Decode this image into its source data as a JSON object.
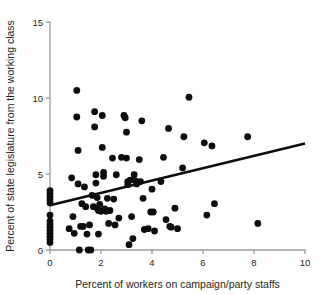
{
  "chart_data": {
    "type": "scatter",
    "title": "",
    "xlabel": "Percent of workers on campaign/party staffs",
    "ylabel": "Percent of state legislature from the working class",
    "xlim": [
      0,
      10
    ],
    "ylim": [
      0,
      15
    ],
    "xticks": [
      0,
      2,
      4,
      6,
      8,
      10
    ],
    "yticks": [
      0,
      5,
      10,
      15
    ],
    "xtick_labels": [
      "0",
      "2",
      "4",
      "6",
      "8",
      "10"
    ],
    "ytick_labels": [
      "0",
      "5",
      "10",
      "15"
    ],
    "grid": false,
    "legend": "none",
    "marker": "filled-circle",
    "marker_color": "#0d0d0d",
    "trend_line": {
      "type": "linear-fit",
      "color": "#0d0d0d",
      "x_start": 0,
      "y_start": 2.95,
      "x_end": 10,
      "y_end": 7.0,
      "slope": 0.405,
      "intercept": 2.95
    },
    "points": [
      [
        0.0,
        0.5
      ],
      [
        0.0,
        0.7
      ],
      [
        0.0,
        0.9
      ],
      [
        0.0,
        1.1
      ],
      [
        0.0,
        1.3
      ],
      [
        0.0,
        1.5
      ],
      [
        0.0,
        1.7
      ],
      [
        0.0,
        1.9
      ],
      [
        0.0,
        2.3
      ],
      [
        0.0,
        3.1
      ],
      [
        0.0,
        3.3
      ],
      [
        0.0,
        3.5
      ],
      [
        0.0,
        3.7
      ],
      [
        0.0,
        3.9
      ],
      [
        0.75,
        1.4
      ],
      [
        0.85,
        4.75
      ],
      [
        0.9,
        2.2
      ],
      [
        0.95,
        1.1
      ],
      [
        1.05,
        10.5
      ],
      [
        1.05,
        8.75
      ],
      [
        1.1,
        6.55
      ],
      [
        1.1,
        4.35
      ],
      [
        1.15,
        0.0
      ],
      [
        1.2,
        1.55
      ],
      [
        1.25,
        3.05
      ],
      [
        1.3,
        1.55
      ],
      [
        1.35,
        4.15
      ],
      [
        1.4,
        2.85
      ],
      [
        1.45,
        1.05
      ],
      [
        1.5,
        0.0
      ],
      [
        1.55,
        1.65
      ],
      [
        1.6,
        0.0
      ],
      [
        1.65,
        3.6
      ],
      [
        1.7,
        2.85
      ],
      [
        1.75,
        9.1
      ],
      [
        1.75,
        8.1
      ],
      [
        1.8,
        4.95
      ],
      [
        1.8,
        4.4
      ],
      [
        1.85,
        3.45
      ],
      [
        1.85,
        2.75
      ],
      [
        1.9,
        2.6
      ],
      [
        1.9,
        1.05
      ],
      [
        1.95,
        3.0
      ],
      [
        2.0,
        2.55
      ],
      [
        2.05,
        8.85
      ],
      [
        2.05,
        6.75
      ],
      [
        2.1,
        5.1
      ],
      [
        2.1,
        4.85
      ],
      [
        2.15,
        2.7
      ],
      [
        2.2,
        2.55
      ],
      [
        2.25,
        3.4
      ],
      [
        2.3,
        1.75
      ],
      [
        2.35,
        2.6
      ],
      [
        2.45,
        6.05
      ],
      [
        2.5,
        3.35
      ],
      [
        2.55,
        1.65
      ],
      [
        2.6,
        4.95
      ],
      [
        2.7,
        2.1
      ],
      [
        2.8,
        6.1
      ],
      [
        2.9,
        8.85
      ],
      [
        2.95,
        8.7
      ],
      [
        3.0,
        7.75
      ],
      [
        3.0,
        6.05
      ],
      [
        3.05,
        4.5
      ],
      [
        3.05,
        4.3
      ],
      [
        3.1,
        0.35
      ],
      [
        3.15,
        4.6
      ],
      [
        3.2,
        2.2
      ],
      [
        3.25,
        0.75
      ],
      [
        3.3,
        4.95
      ],
      [
        3.35,
        4.55
      ],
      [
        3.4,
        4.35
      ],
      [
        3.5,
        5.95
      ],
      [
        3.55,
        4.5
      ],
      [
        3.6,
        8.5
      ],
      [
        3.65,
        3.4
      ],
      [
        3.7,
        1.35
      ],
      [
        3.85,
        1.4
      ],
      [
        3.95,
        2.5
      ],
      [
        4.0,
        4.0
      ],
      [
        4.05,
        2.5
      ],
      [
        4.1,
        1.25
      ],
      [
        4.35,
        4.5
      ],
      [
        4.45,
        6.1
      ],
      [
        4.55,
        2.0
      ],
      [
        4.65,
        8.0
      ],
      [
        4.7,
        1.55
      ],
      [
        4.75,
        1.5
      ],
      [
        4.9,
        2.75
      ],
      [
        5.0,
        1.4
      ],
      [
        5.2,
        5.4
      ],
      [
        5.25,
        7.45
      ],
      [
        5.45,
        10.05
      ],
      [
        6.05,
        7.05
      ],
      [
        6.15,
        2.3
      ],
      [
        6.35,
        6.85
      ],
      [
        6.45,
        3.05
      ],
      [
        7.75,
        7.45
      ],
      [
        8.15,
        1.75
      ]
    ]
  }
}
